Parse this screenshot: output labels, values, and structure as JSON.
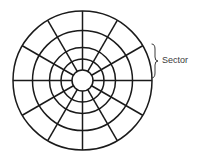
{
  "diagram": {
    "center": [
      82.5,
      80.5
    ],
    "ring_radii": [
      10.5,
      21.5,
      33,
      50,
      69.5
    ],
    "spoke_count": 12,
    "spoke_start_angle_deg": 0,
    "spoke_inner_radius": 10.5,
    "spoke_outer_radius": 69.5,
    "stroke_color": "#1a1a1a",
    "stroke_width": 1.5,
    "annotation": {
      "label": "Sector",
      "brace": {
        "x": 152,
        "y_top": 44,
        "y_bottom": 78,
        "tip_x": 158
      },
      "color": "#3a3a3a"
    }
  }
}
